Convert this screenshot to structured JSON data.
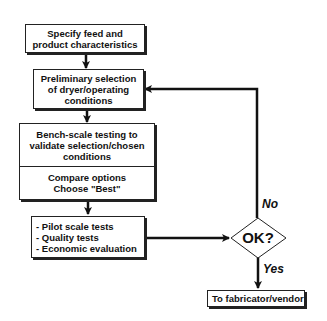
{
  "flowchart": {
    "steps": [
      {
        "id": "specify",
        "lines": [
          "Specify feed and",
          "product characteristics"
        ]
      },
      {
        "id": "preliminary",
        "lines": [
          "Preliminary selection",
          "of dryer/operating",
          "conditions"
        ]
      },
      {
        "id": "bench",
        "lines": [
          "Bench-scale testing to",
          "validate selection/chosen",
          "conditions"
        ]
      },
      {
        "id": "compare",
        "lines": [
          "Compare options",
          "Choose \"Best\""
        ]
      },
      {
        "id": "pilot",
        "lines": [
          "- Pilot scale tests",
          "- Quality tests",
          "- Economic evaluation"
        ]
      },
      {
        "id": "fabricator",
        "lines": [
          "To fabricator/vendor"
        ]
      }
    ],
    "decision": {
      "label": "OK?"
    },
    "branches": {
      "no": "No",
      "yes": "Yes"
    }
  }
}
